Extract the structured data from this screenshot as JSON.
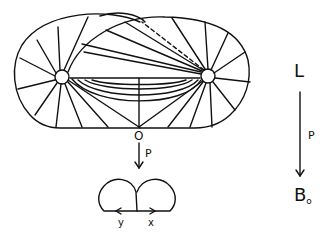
{
  "diagram": {
    "main_figure": {
      "point_label": "O",
      "left_node": "left-puncture",
      "right_node": "right-puncture"
    },
    "projection_arrow_label": "P",
    "lower_figure": {
      "left_label": "y",
      "right_label": "x"
    },
    "right_sequence": {
      "top_label": "L",
      "arrow_label": "P",
      "bottom_label": "B",
      "bottom_subscript": "o"
    },
    "colors": {
      "stroke": "#111111",
      "background": "#ffffff"
    }
  }
}
